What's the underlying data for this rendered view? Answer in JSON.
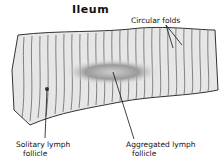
{
  "title": "Ileum",
  "labels": {
    "circular_folds": "Circular  folds",
    "solitary_line1": "Solitary  lymph",
    "solitary_line2": "follicle",
    "aggregated_line1": "Aggregated   lymph",
    "aggregated_line2": "follicle"
  },
  "colors": {
    "tissue_fill": "#e4e4e4",
    "fold_lines": "#5a5a5a",
    "follicle_patch": "#8a8a8a",
    "outline": "#222222"
  }
}
